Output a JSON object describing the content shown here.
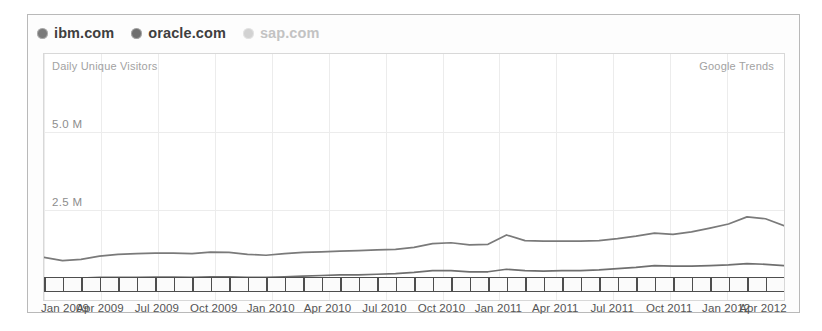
{
  "legend": {
    "items": [
      {
        "label": "ibm.com",
        "color": "#7a7a7a",
        "active": true,
        "icon": "circle-marker-icon"
      },
      {
        "label": "oracle.com",
        "color": "#6f6f6f",
        "active": true,
        "icon": "circle-marker-icon"
      },
      {
        "label": "sap.com",
        "color": "#d2d2d2",
        "active": false,
        "icon": "circle-marker-icon"
      }
    ]
  },
  "plot": {
    "metric_label": "Daily Unique Visitors",
    "watermark": "Google Trends"
  },
  "chart_data": {
    "type": "line",
    "title": "Daily Unique Visitors",
    "subtitle": "Google Trends",
    "xlabel": "",
    "ylabel": "Daily Unique Visitors",
    "grid": true,
    "legend_position": "top-left",
    "ylim": [
      0,
      7.5
    ],
    "yunit": "M",
    "ytick_labels": [
      "5.0 M",
      "2.5 M"
    ],
    "ytick_values": [
      5.0,
      2.5
    ],
    "xtick_labels": [
      "Jan 2009",
      "Apr 2009",
      "Jul 2009",
      "Oct 2009",
      "Jan 2010",
      "Apr 2010",
      "Jul 2010",
      "Oct 2010",
      "Jan 2011",
      "Apr 2011",
      "Jul 2011",
      "Oct 2011",
      "Jan 2012",
      "Apr 2012"
    ],
    "x": [
      "Jan 2009",
      "Feb 2009",
      "Mar 2009",
      "Apr 2009",
      "May 2009",
      "Jun 2009",
      "Jul 2009",
      "Aug 2009",
      "Sep 2009",
      "Oct 2009",
      "Nov 2009",
      "Dec 2009",
      "Jan 2010",
      "Feb 2010",
      "Mar 2010",
      "Apr 2010",
      "May 2010",
      "Jun 2010",
      "Jul 2010",
      "Aug 2010",
      "Sep 2010",
      "Oct 2010",
      "Nov 2010",
      "Dec 2010",
      "Jan 2011",
      "Feb 2011",
      "Mar 2011",
      "Apr 2011",
      "May 2011",
      "Jun 2011",
      "Jul 2011",
      "Aug 2011",
      "Sep 2011",
      "Oct 2011",
      "Nov 2011",
      "Dec 2011",
      "Jan 2012",
      "Feb 2012",
      "Mar 2012",
      "Apr 2012",
      "May 2012"
    ],
    "series": [
      {
        "name": "ibm.com",
        "color": "#7a7a7a",
        "values": [
          0.98,
          0.88,
          0.92,
          1.02,
          1.08,
          1.1,
          1.12,
          1.12,
          1.1,
          1.15,
          1.14,
          1.08,
          1.05,
          1.1,
          1.14,
          1.16,
          1.18,
          1.2,
          1.22,
          1.24,
          1.3,
          1.42,
          1.45,
          1.38,
          1.4,
          1.7,
          1.52,
          1.5,
          1.5,
          1.5,
          1.52,
          1.58,
          1.66,
          1.76,
          1.72,
          1.8,
          1.92,
          2.05,
          2.28,
          2.22,
          2.0
        ]
      },
      {
        "name": "oracle.com",
        "color": "#6f6f6f",
        "values": [
          0.32,
          0.3,
          0.32,
          0.34,
          0.34,
          0.34,
          0.35,
          0.35,
          0.34,
          0.36,
          0.36,
          0.34,
          0.34,
          0.36,
          0.38,
          0.4,
          0.42,
          0.42,
          0.44,
          0.46,
          0.5,
          0.56,
          0.56,
          0.52,
          0.52,
          0.6,
          0.56,
          0.54,
          0.56,
          0.56,
          0.58,
          0.62,
          0.66,
          0.72,
          0.7,
          0.7,
          0.72,
          0.74,
          0.78,
          0.76,
          0.72
        ]
      },
      {
        "name": "sap.com",
        "color": "#d2d2d2",
        "values": [
          0.04,
          0.04,
          0.04,
          0.04,
          0.04,
          0.04,
          0.04,
          0.04,
          0.04,
          0.04,
          0.04,
          0.04,
          0.04,
          0.04,
          0.04,
          0.04,
          0.04,
          0.04,
          0.04,
          0.04,
          0.04,
          0.04,
          0.04,
          0.04,
          0.04,
          0.04,
          0.04,
          0.04,
          0.04,
          0.04,
          0.04,
          0.04,
          0.04,
          0.04,
          0.04,
          0.04,
          0.04,
          0.04,
          0.04,
          0.04,
          0.04
        ]
      }
    ]
  }
}
